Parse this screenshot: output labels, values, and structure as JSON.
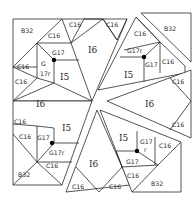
{
  "diagram": {
    "type": "quilt-block-piecing-diagram",
    "labels": {
      "tl_b32": "B32",
      "tl_c16_a": "C16",
      "tl_c16_b": "C16",
      "tl_c16_c": "C16",
      "tl_c16_d": "C16",
      "tl_g": "G",
      "tl_17r": "17r",
      "tl_g17": "G17",
      "tl_i5": "I5",
      "top_i6": "I6",
      "top_c16_r": "C16",
      "tr_b32": "B32",
      "tr_c16_a": "C16",
      "tr_g17r": "G17r",
      "tr_g17": "G17",
      "tr_c16_b": "C16",
      "tr_i5": "I5",
      "right_i6": "I6",
      "right_c16_a": "C16",
      "right_c16_b": "C16",
      "left_i6": "I6",
      "bl_c16_a": "C16",
      "bl_c16_b": "C16",
      "bl_g17": "G17",
      "bl_i5": "I5",
      "bl_g17r": "G17r",
      "bl_c16_c": "C16",
      "bl_b32": "B32",
      "bottom_i6": "I6",
      "bottom_c16_a": "C16",
      "bottom_c16_b": "C16",
      "br_i5": "I5",
      "br_g17": "G17",
      "br_r": "r",
      "br_c16_a": "C16",
      "br_g17b": "G17",
      "br_c16_b": "C16",
      "br_b32": "B32"
    },
    "line_color": "#2a2a2a",
    "background": "#ffffff"
  }
}
